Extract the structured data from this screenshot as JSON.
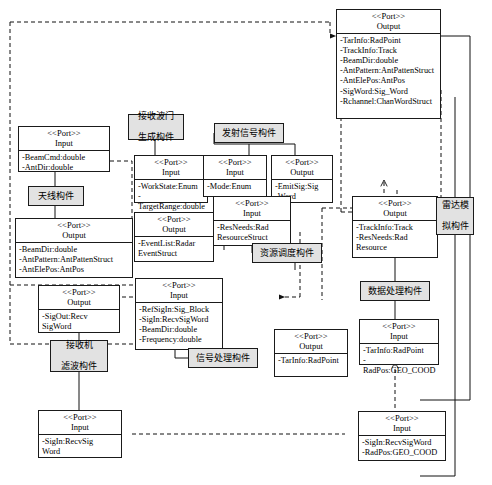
{
  "diagram": {
    "stereotype": "<<Port>>",
    "kind_output": "Output",
    "kind_input": "Input"
  },
  "components": [
    {
      "id": "recv-gate",
      "label_line1": "接收波门",
      "label_line2": "生成构件"
    },
    {
      "id": "antenna",
      "label_line1": "天线构件",
      "label_line2": ""
    },
    {
      "id": "emit-sig",
      "label_line1": "发射信号构件",
      "label_line2": ""
    },
    {
      "id": "res-sched",
      "label_line1": "资源调度构件",
      "label_line2": ""
    },
    {
      "id": "radar-sim",
      "label_line1": "雷达模",
      "label_line2": "拟构件"
    },
    {
      "id": "recv-filter",
      "label_line1": "接收机",
      "label_line2": "滤波构件"
    },
    {
      "id": "sig-proc",
      "label_line1": "信号处理构件",
      "label_line2": ""
    },
    {
      "id": "data-proc",
      "label_line1": "数据处理构件",
      "label_line2": ""
    }
  ],
  "ports": [
    {
      "id": "p-recvgate-out",
      "stereotype": "<<Port>>",
      "kind": "Output",
      "attrs": [
        "-RecvChW:Channel",
        "Word"
      ]
    },
    {
      "id": "p-antenna-in",
      "stereotype": "<<Port>>",
      "kind": "Input",
      "attrs": [
        "-BeamCmd:double",
        "-AntDir:double"
      ]
    },
    {
      "id": "p-antenna-out",
      "stereotype": "<<Port>>",
      "kind": "Output",
      "attrs": [
        "-BeamDir:double",
        "-AntPattern:AntPattenStruct",
        "-AntElePos:AntPos"
      ]
    },
    {
      "id": "p-recvgate-in",
      "stereotype": "<<Port>>",
      "kind": "Input",
      "attrs": [
        "-WorkState:Enum",
        "-TargetRange:double"
      ]
    },
    {
      "id": "p-recvgate-out2",
      "stereotype": "<<Port>>",
      "kind": "Output",
      "attrs": [
        "-EventList:Radar",
        "EventStruct"
      ]
    },
    {
      "id": "p-emit-in",
      "stereotype": "<<Port>>",
      "kind": "Input",
      "attrs": [
        "-Mode:Enum"
      ]
    },
    {
      "id": "p-emit-out",
      "stereotype": "<<Port>>",
      "kind": "Output",
      "attrs": [
        "-EmitSig:Sig",
        "-Word"
      ]
    },
    {
      "id": "p-radarsim-out",
      "stereotype": "<<Port>>",
      "kind": "Output",
      "attrs": [
        "-TarInfo:RadPoint",
        "-TrackInfo:Track",
        "-BeamDir:double",
        "-AntPattern:AntPattenStruct",
        "-AntElePos:AntPos",
        "-SigWord:Sig_Word",
        "-Rchannel:ChanWordStruct"
      ]
    },
    {
      "id": "p-ressched-in",
      "stereotype": "<<Port>>",
      "kind": "Input",
      "attrs": [
        "-ResNeeds:Rad",
        "ResourceStruct"
      ]
    },
    {
      "id": "p-ressched-out",
      "stereotype": "<<Port>>",
      "kind": "Output",
      "attrs": [
        "-TrackInfo:Track",
        "-ResNeeds:Rad",
        "Resource"
      ]
    },
    {
      "id": "p-sigproc-in",
      "stereotype": "<<Port>>",
      "kind": "Input",
      "attrs": [
        "-RefSigIn:Sig_Block",
        "-SigIn:RecvSigWord",
        "-BeamDir:double",
        "-Frequency:double"
      ]
    },
    {
      "id": "p-recvfilter-out",
      "stereotype": "<<Port>>",
      "kind": "Output",
      "attrs": [
        "-SigOut:Recv",
        "SigWord"
      ]
    },
    {
      "id": "p-sigproc-out",
      "stereotype": "<<Port>>",
      "kind": "Output",
      "attrs": [
        "-TarInfo:RadPoint"
      ]
    },
    {
      "id": "p-dataproc-in",
      "stereotype": "<<Port>>",
      "kind": "Input",
      "attrs": [
        "-TarInfo:RadPoint",
        "-RadPos:GEO_COOD"
      ]
    },
    {
      "id": "p-recvfilter-in",
      "stereotype": "<<Port>>",
      "kind": "Input",
      "attrs": [
        "-SigIn:RecvSig",
        "Word"
      ]
    },
    {
      "id": "p-bottomright-in",
      "stereotype": "<<Port>>",
      "kind": "Input",
      "attrs": [
        "-SigIn:RecvSigWord",
        "-RadPos:GEO_COOD"
      ]
    }
  ]
}
